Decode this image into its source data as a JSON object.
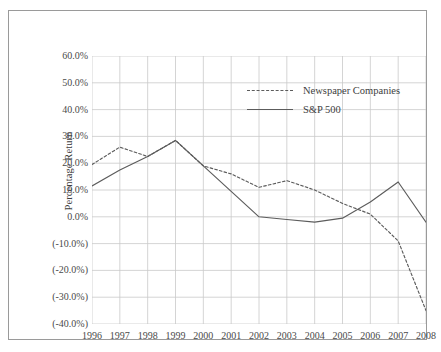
{
  "chart_data": {
    "type": "line",
    "title": "",
    "xlabel": "",
    "ylabel": "Percentage Return",
    "x": [
      1996,
      1997,
      1998,
      1999,
      2000,
      2001,
      2002,
      2003,
      2004,
      2005,
      2006,
      2007,
      2008
    ],
    "categories": [
      "1996",
      "1997",
      "1998",
      "1999",
      "2000",
      "2001",
      "2002",
      "2003",
      "2004",
      "2005",
      "2006",
      "2007",
      "2008"
    ],
    "xlim": [
      1996,
      2008
    ],
    "ylim": [
      -40,
      60
    ],
    "ytick_values": [
      60,
      50,
      40,
      30,
      20,
      10,
      0,
      -10,
      -20,
      -30,
      -40
    ],
    "ytick_labels": [
      "60.0%",
      "50.0%",
      "40.0%",
      "30.0%",
      "20.0%",
      "10.0%",
      "0.0%",
      "(-10.0%)",
      "(-20.0%)",
      "(-30.0%)",
      "(-40.0%)"
    ],
    "grid": true,
    "grid_color": "#c9c9c9",
    "legend_position": "upper-right-inside",
    "series": [
      {
        "name": "Newspaper Companies",
        "style": "dashed",
        "color": "#5c5c5c",
        "values": [
          19.5,
          26.0,
          22.5,
          28.5,
          19.0,
          16.0,
          11.0,
          13.5,
          10.0,
          5.0,
          1.0,
          -9.0,
          -35.0
        ]
      },
      {
        "name": "S&P 500",
        "style": "solid",
        "color": "#5c5c5c",
        "values": [
          11.5,
          17.5,
          22.5,
          28.5,
          19.0,
          9.5,
          0.0,
          -1.0,
          -2.0,
          -0.5,
          5.5,
          13.0,
          -2.0
        ]
      }
    ]
  },
  "legend": {
    "items": [
      {
        "label": "Newspaper Companies",
        "style": "dashed"
      },
      {
        "label": "S&P 500",
        "style": "solid"
      }
    ]
  },
  "axes": {
    "y_title": "Percentage Return"
  },
  "caption": {
    "text": ""
  }
}
